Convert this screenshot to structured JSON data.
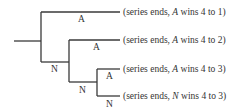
{
  "diagram": {
    "type": "decision-tree",
    "edge_color": "#3a3a3a",
    "branch_labels": [
      {
        "id": "b1",
        "label": "A"
      },
      {
        "id": "b2",
        "label": "N"
      },
      {
        "id": "b3",
        "label": "A"
      },
      {
        "id": "b4",
        "label": "N"
      },
      {
        "id": "b5",
        "label": "A"
      },
      {
        "id": "b6",
        "label": "N"
      }
    ],
    "outcomes": [
      {
        "prefix": "(series ends, ",
        "winner": "A",
        "suffix": " wins 4 to 1)"
      },
      {
        "prefix": "(series ends, ",
        "winner": "A",
        "suffix": " wins 4 to 2)"
      },
      {
        "prefix": "(series ends, ",
        "winner": "A",
        "suffix": " wins 4 to 3)"
      },
      {
        "prefix": "(series ends, ",
        "winner": "N",
        "suffix": " wins 4 to 3)"
      }
    ]
  }
}
